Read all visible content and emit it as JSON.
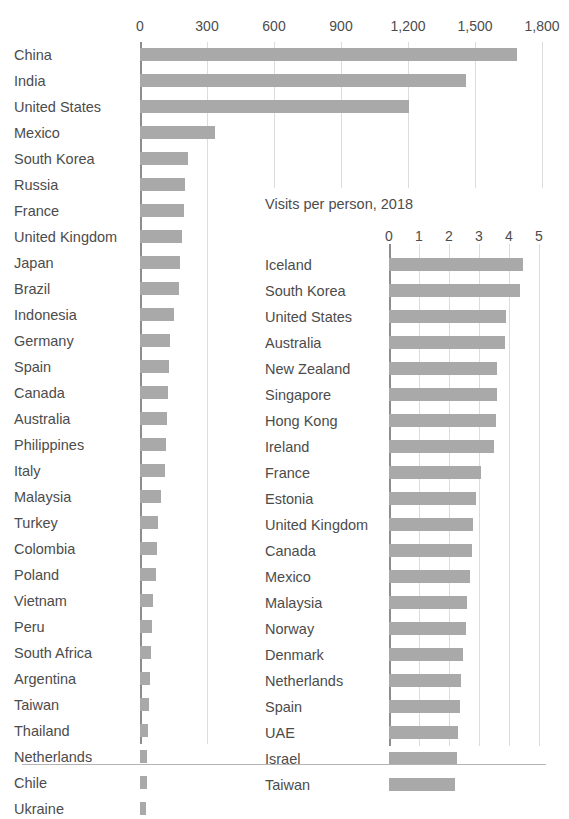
{
  "chart_data": [
    {
      "id": "main",
      "type": "bar",
      "orientation": "horizontal",
      "title": "",
      "xlabel": "",
      "ylabel": "",
      "xlim": [
        0,
        1800
      ],
      "xticks": [
        0,
        300,
        600,
        900,
        1200,
        1500,
        1800
      ],
      "xtick_labels": [
        "0",
        "300",
        "600",
        "900",
        "1,200",
        "1,500",
        "1,800"
      ],
      "grid": true,
      "legend": "none",
      "bar_color": "#a9a9a9",
      "categories": [
        "China",
        "India",
        "United States",
        "Mexico",
        "South Korea",
        "Russia",
        "France",
        "United Kingdom",
        "Japan",
        "Brazil",
        "Indonesia",
        "Germany",
        "Spain",
        "Canada",
        "Australia",
        "Philippines",
        "Italy",
        "Malaysia",
        "Turkey",
        "Colombia",
        "Poland",
        "Vietnam",
        "Peru",
        "South Africa",
        "Argentina",
        "Taiwan",
        "Thailand",
        "Netherlands",
        "Chile",
        "Ukraine"
      ],
      "values": [
        1690,
        1460,
        1205,
        335,
        215,
        200,
        195,
        190,
        180,
        175,
        150,
        135,
        130,
        125,
        120,
        115,
        110,
        95,
        80,
        75,
        70,
        60,
        55,
        50,
        45,
        42,
        36,
        33,
        30,
        26
      ]
    },
    {
      "id": "inset",
      "type": "bar",
      "orientation": "horizontal",
      "title": "Visits per person, 2018",
      "xlabel": "",
      "ylabel": "",
      "xlim": [
        0,
        5
      ],
      "xticks": [
        0,
        1,
        2,
        3,
        4,
        5
      ],
      "xtick_labels": [
        "0",
        "1",
        "2",
        "3",
        "4",
        "5"
      ],
      "grid": true,
      "legend": "none",
      "bar_color": "#a9a9a9",
      "categories": [
        "Iceland",
        "South Korea",
        "United States",
        "Australia",
        "New Zealand",
        "Singapore",
        "Hong Kong",
        "Ireland",
        "France",
        "Estonia",
        "United Kingdom",
        "Canada",
        "Mexico",
        "Malaysia",
        "Norway",
        "Denmark",
        "Netherlands",
        "Spain",
        "UAE",
        "Israel",
        "Taiwan"
      ],
      "values": [
        4.45,
        4.35,
        3.9,
        3.85,
        3.6,
        3.6,
        3.55,
        3.5,
        3.05,
        2.9,
        2.8,
        2.75,
        2.7,
        2.6,
        2.55,
        2.45,
        2.4,
        2.35,
        2.3,
        2.25,
        2.2
      ]
    }
  ],
  "main": {
    "xtick_labels": [
      "0",
      "300",
      "600",
      "900",
      "1,200",
      "1,500",
      "1,800"
    ],
    "categories": [
      "China",
      "India",
      "United States",
      "Mexico",
      "South Korea",
      "Russia",
      "France",
      "United Kingdom",
      "Japan",
      "Brazil",
      "Indonesia",
      "Germany",
      "Spain",
      "Canada",
      "Australia",
      "Philippines",
      "Italy",
      "Malaysia",
      "Turkey",
      "Colombia",
      "Poland",
      "Vietnam",
      "Peru",
      "South Africa",
      "Argentina",
      "Taiwan",
      "Thailand",
      "Netherlands",
      "Chile",
      "Ukraine"
    ]
  },
  "inset": {
    "title": "Visits per person, 2018",
    "xtick_labels": [
      "0",
      "1",
      "2",
      "3",
      "4",
      "5"
    ],
    "categories": [
      "Iceland",
      "South Korea",
      "United States",
      "Australia",
      "New Zealand",
      "Singapore",
      "Hong Kong",
      "Ireland",
      "France",
      "Estonia",
      "United Kingdom",
      "Canada",
      "Mexico",
      "Malaysia",
      "Norway",
      "Denmark",
      "Netherlands",
      "Spain",
      "UAE",
      "Israel",
      "Taiwan"
    ]
  },
  "colors": {
    "bar": "#a9a9a9",
    "gridline": "#dcdcdc",
    "axis": "#8d8d8d",
    "text": "#4c4c4c",
    "rule": "#b4b4b4"
  }
}
